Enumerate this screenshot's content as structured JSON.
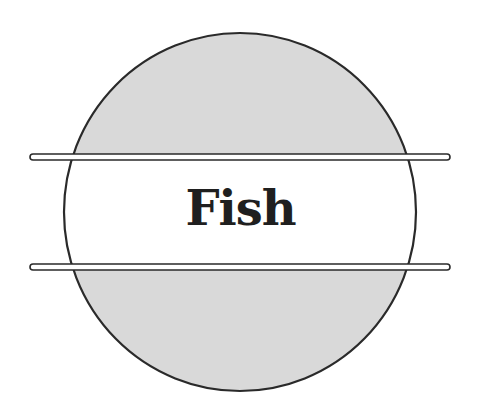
{
  "logo": {
    "text": "Fish",
    "colors": {
      "background": "#ffffff",
      "fill": "#d9d9d9",
      "stroke": "#2a2a2a",
      "text": "#1f1f1f"
    }
  }
}
